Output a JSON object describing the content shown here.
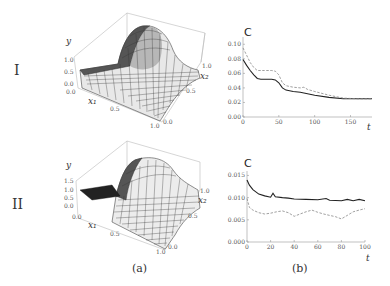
{
  "labels": {
    "row1": "I",
    "row2": "II",
    "panel_a": "(a)",
    "panel_b": "(b)"
  },
  "surface_plots": [
    {
      "row": "I",
      "axis_labels": {
        "y": "y",
        "x1": "x₁",
        "x2": "x₂"
      },
      "y_ticks": [
        "1.0",
        "0.5",
        "0.0"
      ],
      "x1_ticks": [
        "0.0",
        "0.5",
        "1.0"
      ],
      "x2_ticks": [
        "0.0",
        "0.5",
        "1.0"
      ]
    },
    {
      "row": "II",
      "axis_labels": {
        "y": "y",
        "x1": "x₁",
        "x2": "x₂"
      },
      "y_ticks": [
        "1.5",
        "1.0",
        "0.5",
        "0.0"
      ],
      "x1_ticks": [
        "0.0",
        "0.5",
        "1.0"
      ],
      "x2_ticks": [
        "0.0",
        "0.5",
        "1.0"
      ]
    }
  ],
  "chart_data": [
    {
      "type": "line",
      "title": "",
      "ylabel": "C",
      "xlabel": "t",
      "xlim": [
        0,
        180
      ],
      "ylim": [
        0,
        0.11
      ],
      "x_ticks": [
        0,
        50,
        100,
        150
      ],
      "y_ticks": [
        "0.00",
        "0.02",
        "0.04",
        "0.06",
        "0.08",
        "0.10"
      ],
      "grid": false,
      "series": [
        {
          "name": "solid",
          "style": "solid",
          "x": [
            0,
            5,
            10,
            15,
            20,
            25,
            30,
            40,
            45,
            50,
            55,
            60,
            70,
            80,
            90,
            100,
            120,
            140,
            160,
            180
          ],
          "values": [
            0.079,
            0.071,
            0.064,
            0.058,
            0.053,
            0.052,
            0.052,
            0.052,
            0.051,
            0.047,
            0.04,
            0.037,
            0.035,
            0.034,
            0.032,
            0.03,
            0.027,
            0.025,
            0.025,
            0.025
          ]
        },
        {
          "name": "dashed",
          "style": "dashed",
          "x": [
            0,
            5,
            10,
            15,
            20,
            25,
            30,
            40,
            45,
            50,
            55,
            60,
            70,
            80,
            85,
            90,
            100,
            120,
            140,
            160,
            180
          ],
          "values": [
            0.095,
            0.085,
            0.075,
            0.068,
            0.064,
            0.064,
            0.064,
            0.064,
            0.063,
            0.058,
            0.047,
            0.043,
            0.041,
            0.04,
            0.041,
            0.038,
            0.035,
            0.03,
            0.026,
            0.025,
            0.025
          ]
        }
      ]
    },
    {
      "type": "line",
      "title": "",
      "ylabel": "C",
      "xlabel": "t",
      "xlim": [
        0,
        100
      ],
      "ylim": [
        0,
        0.016
      ],
      "x_ticks": [
        0,
        20,
        40,
        60,
        80,
        100
      ],
      "y_ticks": [
        "0.000",
        "0.005",
        "0.010",
        "0.015"
      ],
      "grid": false,
      "series": [
        {
          "name": "solid",
          "style": "solid",
          "x": [
            0,
            2,
            5,
            10,
            15,
            20,
            22,
            24,
            30,
            35,
            40,
            50,
            60,
            67,
            70,
            80,
            85,
            90,
            95,
            100
          ],
          "values": [
            0.014,
            0.0128,
            0.0118,
            0.0108,
            0.0104,
            0.0101,
            0.011,
            0.0102,
            0.01,
            0.0099,
            0.0097,
            0.0096,
            0.0095,
            0.0098,
            0.0094,
            0.0093,
            0.0096,
            0.0093,
            0.0096,
            0.0093
          ]
        },
        {
          "name": "dashed",
          "style": "dashed",
          "x": [
            0,
            2,
            5,
            10,
            15,
            20,
            25,
            30,
            35,
            40,
            45,
            50,
            55,
            60,
            65,
            70,
            75,
            80,
            85,
            90,
            95,
            100
          ],
          "values": [
            0.0098,
            0.0078,
            0.0072,
            0.0066,
            0.0063,
            0.0065,
            0.0068,
            0.007,
            0.0066,
            0.0058,
            0.0063,
            0.0068,
            0.0072,
            0.0067,
            0.0063,
            0.006,
            0.0057,
            0.0052,
            0.006,
            0.0068,
            0.0072,
            0.0075
          ]
        }
      ]
    }
  ]
}
